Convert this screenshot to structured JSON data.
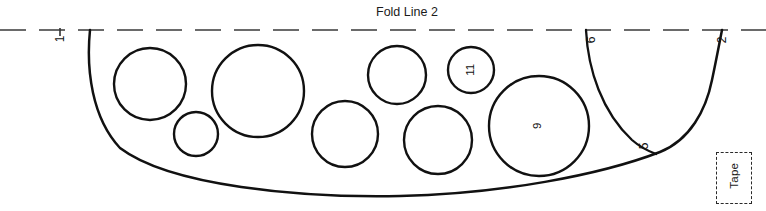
{
  "diagram": {
    "type": "sewing-pattern-piece",
    "title": "Fold Line 2",
    "background_color": "#ffffff",
    "ink_color": "#111111",
    "fold_line": {
      "label": "Fold Line 2",
      "style": "dashed",
      "color": "#5a5a5a",
      "y": 30
    },
    "edge_labels": [
      {
        "id": "edge-1",
        "text": "1",
        "x": 62,
        "y": 39,
        "rotated": true
      },
      {
        "id": "edge-6",
        "text": "6",
        "x": 592,
        "y": 40,
        "rotated": true
      },
      {
        "id": "edge-2",
        "text": "2",
        "x": 723,
        "y": 40,
        "rotated": true
      },
      {
        "id": "edge-5",
        "text": "5",
        "x": 645,
        "y": 146,
        "rotated": true
      }
    ],
    "circles": [
      {
        "id": "circle-a",
        "cx": 150,
        "cy": 84,
        "r": 36,
        "label": ""
      },
      {
        "id": "circle-b",
        "cx": 196,
        "cy": 134,
        "r": 22,
        "label": ""
      },
      {
        "id": "circle-c",
        "cx": 258,
        "cy": 91,
        "r": 46,
        "label": ""
      },
      {
        "id": "circle-d",
        "cx": 345,
        "cy": 134,
        "r": 33,
        "label": ""
      },
      {
        "id": "circle-e",
        "cx": 397,
        "cy": 75,
        "r": 29,
        "label": ""
      },
      {
        "id": "circle-f",
        "cx": 438,
        "cy": 140,
        "r": 34,
        "label": ""
      },
      {
        "id": "circle-g",
        "cx": 471,
        "cy": 70,
        "r": 23,
        "label": "11"
      },
      {
        "id": "circle-h",
        "cx": 539,
        "cy": 126,
        "r": 50,
        "label": "9"
      }
    ],
    "tape": {
      "label": "Tape",
      "rotated": true,
      "bracket_style": "dashed",
      "x": 716,
      "y": 152,
      "width": 34,
      "height": 50
    }
  }
}
